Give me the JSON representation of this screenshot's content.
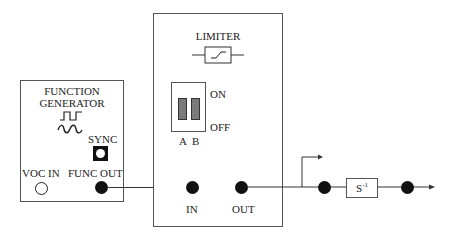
{
  "function_generator": {
    "title_line1": "FUNCTION",
    "title_line2": "GENERATOR",
    "square_wave_icon": "square-wave",
    "sine_wave_icon": "sine-wave",
    "sync_label": "SYNC",
    "voc_in_label": "VOC IN",
    "func_out_label": "FUNC OUT"
  },
  "limiter": {
    "title": "LIMITER",
    "symbol_icon": "limiter-symbol",
    "switch": {
      "on_label": "ON",
      "off_label": "OFF",
      "a_label": "A",
      "b_label": "B"
    },
    "in_label": "IN",
    "out_label": "OUT"
  },
  "output_chain": {
    "integrator_label": "S",
    "integrator_exponent": "-1"
  },
  "colors": {
    "line": "#333333",
    "jack": "#111111",
    "switch_lever": "#7a7a7a"
  }
}
